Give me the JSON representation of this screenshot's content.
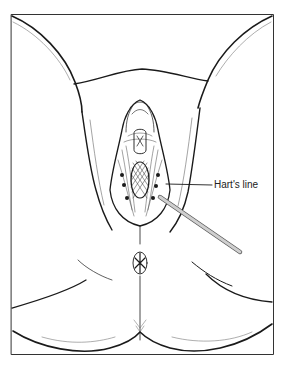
{
  "figure": {
    "type": "anatomical line drawing",
    "background": "#ffffff",
    "stroke_color": "#1a1a1a",
    "probe_color": "#c8c8c8"
  },
  "annotations": [
    {
      "label": "Hart's line",
      "leader_from": [
        212,
        185
      ],
      "leader_to": [
        166,
        184
      ]
    }
  ]
}
